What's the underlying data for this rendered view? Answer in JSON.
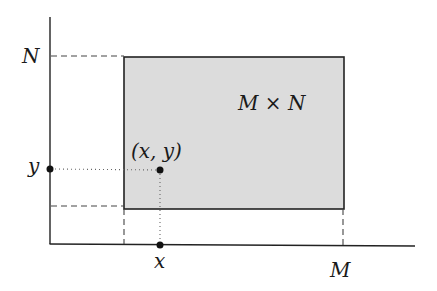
{
  "diagram": {
    "labels": {
      "y_axis_max": "N",
      "x_axis_max": "M",
      "point_y": "y",
      "point_x": "x",
      "point": "(x, y)",
      "region": "M × N"
    },
    "colors": {
      "region_fill": "#dcdcdc",
      "stroke": "#222222",
      "guide": "#444444"
    }
  }
}
